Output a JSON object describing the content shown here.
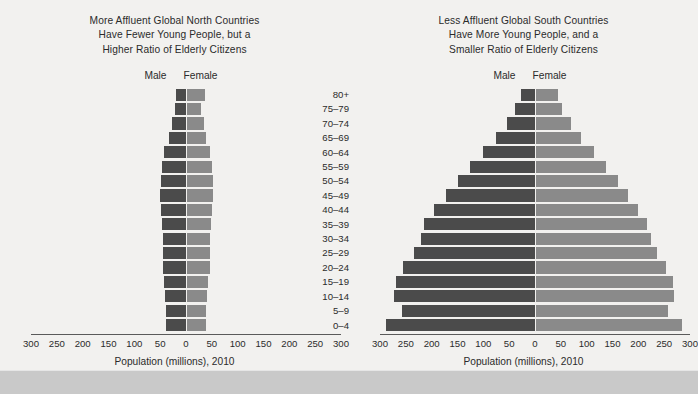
{
  "figure": {
    "footer_band": true,
    "colors": {
      "background": "#f2f1ef",
      "male_bar": "#4b4b4b",
      "female_bar": "#8a8a8a",
      "axis": "#5a5a5a",
      "text": "#2b2b2b",
      "footer_band": "#c9c9c9"
    }
  },
  "age_labels": [
    "80+",
    "75–79",
    "70–74",
    "65–69",
    "60–64",
    "55–59",
    "50–54",
    "45–49",
    "40–44",
    "35–39",
    "30–34",
    "25–29",
    "20–24",
    "15–19",
    "10–14",
    "5–9",
    "0–4"
  ],
  "left_panel": {
    "title_lines": [
      "More Affluent Global North Countries",
      "Have Fewer Young People, but a",
      "Higher Ratio of Elderly Citizens"
    ],
    "male_label": "Male",
    "female_label": "Female",
    "axis_caption": "Population (millions), 2010",
    "tick_labels": [
      "300",
      "250",
      "200",
      "150",
      "100",
      "50",
      "0",
      "50",
      "100",
      "150",
      "200",
      "250",
      "300"
    ]
  },
  "right_panel": {
    "title_lines": [
      "Less Affluent Global South Countries",
      "Have More Young People, and a",
      "Smaller Ratio of Elderly Citizens"
    ],
    "male_label": "Male",
    "female_label": "Female",
    "axis_caption": "Population (millions), 2010",
    "tick_labels": [
      "300",
      "250",
      "200",
      "150",
      "100",
      "50",
      "0",
      "50",
      "100",
      "150",
      "200",
      "250",
      "300"
    ]
  },
  "chart_data": [
    {
      "type": "bar",
      "subtype": "population-pyramid",
      "title": "More Affluent Global North Countries Have Fewer Young People, but a Higher Ratio of Elderly Citizens",
      "xlabel": "Population (millions), 2010",
      "ylabel": "",
      "categories": [
        "80+",
        "75–79",
        "70–74",
        "65–69",
        "60–64",
        "55–59",
        "50–54",
        "45–49",
        "40–44",
        "35–39",
        "30–34",
        "25–29",
        "20–24",
        "15–19",
        "10–14",
        "5–9",
        "0–4"
      ],
      "xlim": [
        -300,
        300
      ],
      "xticks": [
        -300,
        -250,
        -200,
        -150,
        -100,
        -50,
        0,
        50,
        100,
        150,
        200,
        250,
        300
      ],
      "grid": false,
      "legend": [
        "Male",
        "Female"
      ],
      "legend_position": "top-center",
      "series": [
        {
          "name": "Male",
          "values": [
            19,
            21,
            28,
            33,
            42,
            46,
            48,
            50,
            48,
            46,
            45,
            45,
            45,
            42,
            40,
            39,
            39
          ]
        },
        {
          "name": "Female",
          "values": [
            34,
            27,
            32,
            36,
            45,
            48,
            50,
            51,
            48,
            46,
            45,
            45,
            44,
            41,
            38,
            37,
            37
          ]
        }
      ]
    },
    {
      "type": "bar",
      "subtype": "population-pyramid",
      "title": "Less Affluent Global South Countries Have More Young People, and a Smaller Ratio of Elderly Citizens",
      "xlabel": "Population (millions), 2010",
      "ylabel": "",
      "categories": [
        "80+",
        "75–79",
        "70–74",
        "65–69",
        "60–64",
        "55–59",
        "50–54",
        "45–49",
        "40–44",
        "35–39",
        "30–34",
        "25–29",
        "20–24",
        "15–19",
        "10–14",
        "5–9",
        "0–4"
      ],
      "xlim": [
        -300,
        300
      ],
      "xticks": [
        -300,
        -250,
        -200,
        -150,
        -100,
        -50,
        0,
        50,
        100,
        150,
        200,
        250,
        300
      ],
      "grid": false,
      "legend": [
        "Male",
        "Female"
      ],
      "legend_position": "top-center",
      "series": [
        {
          "name": "Male",
          "values": [
            28,
            38,
            55,
            75,
            100,
            125,
            150,
            172,
            195,
            215,
            220,
            235,
            255,
            270,
            272,
            258,
            288
          ]
        },
        {
          "name": "Female",
          "values": [
            42,
            50,
            68,
            88,
            112,
            135,
            158,
            178,
            198,
            215,
            222,
            235,
            252,
            265,
            268,
            255,
            282
          ]
        }
      ]
    }
  ]
}
